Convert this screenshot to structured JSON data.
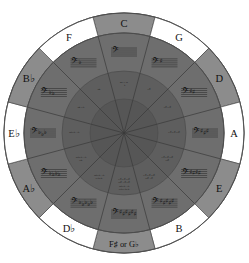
{
  "diagram": {
    "type": "circle-of-fifths-wheel",
    "background_color": "#ffffff",
    "colors": {
      "outer_ring_light": "#ffffff",
      "outer_ring_dark": "#8c8c8c",
      "middle_ring": "#6e6e6e",
      "inner_ring": "#5e5e5e",
      "core": "#565656",
      "outline": "#4a4a4a",
      "text": "#111111"
    },
    "geometry": {
      "center_x": 124,
      "center_y": 133,
      "radius_outer": 120,
      "radius_outer_ring_inner": 100,
      "radius_middle_ring_inner": 62,
      "radius_core": 34,
      "segment_count": 12,
      "segment_degrees": 30
    }
  },
  "segments": [
    {
      "index": 0,
      "key_label": "C",
      "outer_fill": "dark",
      "angle_deg": 0,
      "accidental_count": 0,
      "accidental_type": "none",
      "inner_text": "no # or ♭",
      "staff_accidentals": [],
      "clef": "bass-clef"
    },
    {
      "index": 1,
      "key_label": "G",
      "outer_fill": "light",
      "angle_deg": 30,
      "accidental_count": 1,
      "accidental_type": "sharp",
      "inner_text": "F♯",
      "staff_accidentals": [
        "♯"
      ],
      "clef": "bass-clef"
    },
    {
      "index": 2,
      "key_label": "D",
      "outer_fill": "dark",
      "angle_deg": 60,
      "accidental_count": 2,
      "accidental_type": "sharp",
      "inner_text": "F♯ C♯",
      "staff_accidentals": [
        "♯",
        "♯"
      ],
      "clef": "bass-clef"
    },
    {
      "index": 3,
      "key_label": "A",
      "outer_fill": "light",
      "angle_deg": 90,
      "accidental_count": 3,
      "accidental_type": "sharp",
      "inner_text": "F♯ C♯ G♯",
      "staff_accidentals": [
        "♯",
        "♯",
        "♯"
      ],
      "clef": "bass-clef"
    },
    {
      "index": 4,
      "key_label": "E",
      "outer_fill": "dark",
      "angle_deg": 120,
      "accidental_count": 4,
      "accidental_type": "sharp",
      "inner_text": "F♯ C♯ G♯ D♯",
      "staff_accidentals": [
        "♯",
        "♯",
        "♯",
        "♯"
      ],
      "clef": "bass-clef"
    },
    {
      "index": 5,
      "key_label": "B",
      "outer_fill": "light",
      "angle_deg": 150,
      "accidental_count": 5,
      "accidental_type": "sharp",
      "inner_text": "F♯ C♯ G♯ D♯ A♯",
      "staff_accidentals": [
        "♯",
        "♯",
        "♯",
        "♯",
        "♯"
      ],
      "clef": "bass-clef"
    },
    {
      "index": 6,
      "key_label": "F♯ or G♭",
      "outer_fill": "dark",
      "angle_deg": 180,
      "accidental_count": 6,
      "accidental_type": "both",
      "inner_text": "F♯ C♯ G♯ D♯ A♯ E♯ / B♭ E♭ A♭ D♭ G♭ C♭",
      "staff_accidentals": [
        "♯",
        "♯",
        "♯",
        "♯",
        "♯",
        "♯"
      ],
      "clef": "bass-clef"
    },
    {
      "index": 7,
      "key_label": "D♭",
      "outer_fill": "light",
      "angle_deg": 210,
      "accidental_count": 5,
      "accidental_type": "flat",
      "inner_text": "B♭ E♭ A♭ D♭ G♭",
      "staff_accidentals": [
        "♭",
        "♭",
        "♭",
        "♭",
        "♭"
      ],
      "clef": "bass-clef"
    },
    {
      "index": 8,
      "key_label": "A♭",
      "outer_fill": "dark",
      "angle_deg": 240,
      "accidental_count": 4,
      "accidental_type": "flat",
      "inner_text": "B♭ E♭ A♭ D♭",
      "staff_accidentals": [
        "♭",
        "♭",
        "♭",
        "♭"
      ],
      "clef": "bass-clef"
    },
    {
      "index": 9,
      "key_label": "E♭",
      "outer_fill": "light",
      "angle_deg": 270,
      "accidental_count": 3,
      "accidental_type": "flat",
      "inner_text": "B♭ E♭ A♭",
      "staff_accidentals": [
        "♭",
        "♭",
        "♭"
      ],
      "clef": "bass-clef"
    },
    {
      "index": 10,
      "key_label": "B♭",
      "outer_fill": "dark",
      "angle_deg": 300,
      "accidental_count": 2,
      "accidental_type": "flat",
      "inner_text": "B♭ E♭",
      "staff_accidentals": [
        "♭",
        "♭"
      ],
      "clef": "bass-clef"
    },
    {
      "index": 11,
      "key_label": "F",
      "outer_fill": "light",
      "angle_deg": 330,
      "accidental_count": 1,
      "accidental_type": "flat",
      "inner_text": "B♭",
      "staff_accidentals": [
        "♭"
      ],
      "clef": "bass-clef"
    }
  ]
}
